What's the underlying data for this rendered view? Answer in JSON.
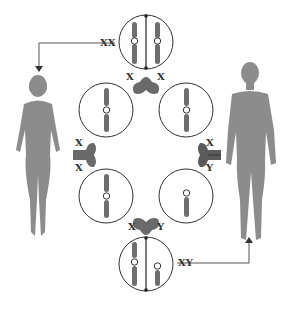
{
  "diagram": {
    "labels": {
      "top_cell": "XX",
      "bottom_cell": "XY",
      "top_junction_left": "X",
      "top_junction_right": "X",
      "left_junction_top": "X",
      "left_junction_bottom": "X",
      "right_junction_top": "X",
      "right_junction_bottom": "Y",
      "bottom_junction_left": "X",
      "bottom_junction_right": "Y"
    },
    "figures": {
      "left": "female",
      "right": "male"
    },
    "colors": {
      "silhouette": "#8c8c8c",
      "chromosome": "#6e6e6e",
      "junction": "#6a6a6a",
      "outline": "#333333"
    }
  }
}
